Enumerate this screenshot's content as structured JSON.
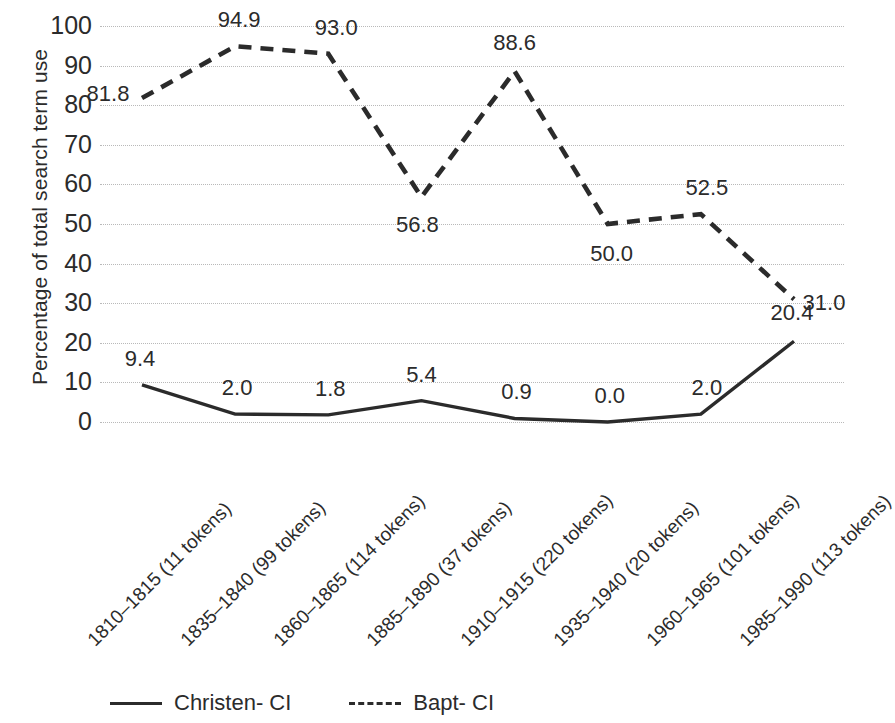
{
  "chart_data": {
    "type": "line",
    "title": "",
    "xlabel": "",
    "ylabel": "Percentage of total search term use",
    "ylim": [
      0,
      100
    ],
    "ytick_step": 10,
    "grid": true,
    "legend_position": "bottom",
    "categories": [
      "1810–1815 (11 tokens)",
      "1835–1840 (99 tokens)",
      "1860–1865 (114 tokens)",
      "1885–1890 (37 tokens)",
      "1910–1915 (220 tokens)",
      "1935–1940 (20 tokens)",
      "1960–1965 (101 tokens)",
      "1985–1990 (113 tokens)"
    ],
    "ytick_labels": [
      "100",
      "90",
      "80",
      "70",
      "60",
      "50",
      "40",
      "30",
      "20",
      "10",
      "0"
    ],
    "series": [
      {
        "name": "Christen- CI",
        "style": "solid",
        "color": "#2b2b2b",
        "values": [
          9.4,
          2.0,
          1.8,
          5.4,
          0.9,
          0.0,
          2.0,
          20.4
        ],
        "labels": [
          "9.4",
          "2.0",
          "1.8",
          "5.4",
          "0.9",
          "0.0",
          "2.0",
          "20.4"
        ]
      },
      {
        "name": "Bapt- CI",
        "style": "dashed",
        "color": "#2b2b2b",
        "values": [
          81.8,
          94.9,
          93.0,
          56.8,
          88.6,
          50.0,
          52.5,
          31.0
        ],
        "labels": [
          "81.8",
          "94.9",
          "93.0",
          "56.8",
          "88.6",
          "50.0",
          "52.5",
          "31.0"
        ]
      }
    ]
  },
  "axis": {
    "y_title": "Percentage of total search term use"
  },
  "legend": {
    "items": [
      {
        "label": "Christen- CI",
        "style": "solid"
      },
      {
        "label": "Bapt- CI",
        "style": "dashed"
      }
    ]
  },
  "label_offsets": {
    "christen": [
      {
        "dx": -2,
        "dy": -26
      },
      {
        "dx": 2,
        "dy": -26
      },
      {
        "dx": 2,
        "dy": -26
      },
      {
        "dx": 0,
        "dy": -26
      },
      {
        "dx": 2,
        "dy": -26
      },
      {
        "dx": 2,
        "dy": -26
      },
      {
        "dx": 6,
        "dy": -26
      },
      {
        "dx": -2,
        "dy": -28
      }
    ],
    "bapt": [
      {
        "dx": -34,
        "dy": -4
      },
      {
        "dx": 4,
        "dy": -26
      },
      {
        "dx": 8,
        "dy": -26
      },
      {
        "dx": -4,
        "dy": 28
      },
      {
        "dx": 0,
        "dy": -28
      },
      {
        "dx": 4,
        "dy": 30
      },
      {
        "dx": 6,
        "dy": -26
      },
      {
        "dx": 30,
        "dy": 4
      }
    ]
  }
}
